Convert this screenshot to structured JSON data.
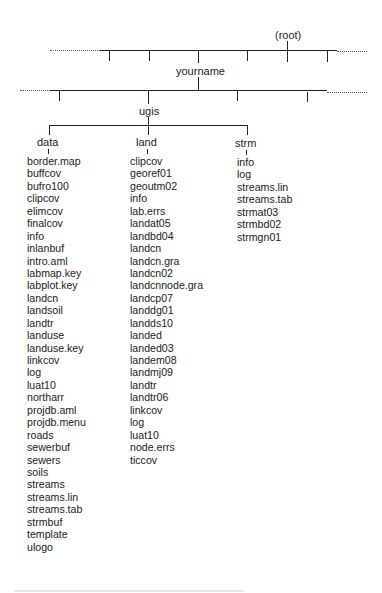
{
  "tree": {
    "root_label": "(root)",
    "level1_label": "yourname",
    "level2_label": "ugis",
    "columns": [
      {
        "name": "data",
        "items": [
          "border.map",
          "buffcov",
          "bufro100",
          "clipcov",
          "elimcov",
          "finalcov",
          "info",
          "inlanbuf",
          "intro.aml",
          "labmap.key",
          "labplot.key",
          "landcn",
          "landsoil",
          "landtr",
          "landuse",
          "landuse.key",
          "linkcov",
          "log",
          "luat10",
          "northarr",
          "projdb.aml",
          "projdb.menu",
          "roads",
          "sewerbuf",
          "sewers",
          "soils",
          "streams",
          "streams.lin",
          "streams.tab",
          "strmbuf",
          "template",
          "ulogo"
        ]
      },
      {
        "name": "land",
        "items": [
          "clipcov",
          "georef01",
          "geoutm02",
          "info",
          "lab.errs",
          "landat05",
          "landbd04",
          "landcn",
          "landcn.gra",
          "landcn02",
          "landcnnode.gra",
          "landcp07",
          "landdg01",
          "landds10",
          "landed",
          "landed03",
          "landem08",
          "landmj09",
          "landtr",
          "landtr06",
          "linkcov",
          "log",
          "luat10",
          "node.errs",
          "ticcov"
        ]
      },
      {
        "name": "strm",
        "items": [
          "info",
          "log",
          "streams.lin",
          "streams.tab",
          "strmat03",
          "strmbd02",
          "strmgn01"
        ]
      }
    ]
  },
  "colors": {
    "line": "#222222",
    "text": "#222222",
    "background": "#ffffff"
  }
}
